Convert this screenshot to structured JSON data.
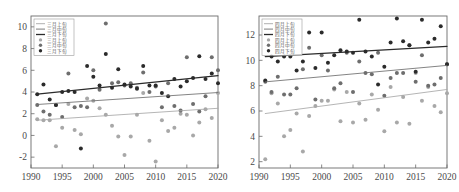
{
  "figure": {
    "name": "two-panel-scatter-trend-figure",
    "width": 459,
    "height": 192,
    "background": "#ffffff"
  },
  "colors": {
    "dark": "#2b2b2b",
    "mid": "#6e6e6e",
    "light": "#a8a8a8",
    "axis": "#6b6b6b",
    "text": "#4a4a4a"
  },
  "chart_data": [
    {
      "type": "scatter",
      "name": "march-panel",
      "title": "",
      "xlabel": "",
      "ylabel": "",
      "xlim": [
        1990,
        2020
      ],
      "ylim": [
        -3,
        11
      ],
      "xticks": [
        1990,
        1995,
        2000,
        2005,
        2010,
        2015,
        2020
      ],
      "yticks": [
        -2,
        0,
        2,
        4,
        6,
        8,
        10
      ],
      "grid": false,
      "legend_position": "upper-left",
      "legend": [
        {
          "label": "三月上旬",
          "type": "line",
          "color": "#a8a8a8"
        },
        {
          "label": "三月中旬",
          "type": "line",
          "color": "#6e6e6e"
        },
        {
          "label": "三月下旬",
          "type": "line",
          "color": "#2b2b2b"
        },
        {
          "label": "三月上旬",
          "type": "marker",
          "color": "#a8a8a8"
        },
        {
          "label": "三月中旬",
          "type": "marker",
          "color": "#6e6e6e"
        },
        {
          "label": "三月下旬",
          "type": "marker",
          "color": "#2b2b2b"
        }
      ],
      "trendlines": [
        {
          "name": "三月下旬",
          "color": "#2b2b2b",
          "x": [
            1991,
            2020
          ],
          "y": [
            3.8,
            5.5
          ]
        },
        {
          "name": "三月中旬",
          "color": "#6e6e6e",
          "x": [
            1991,
            2020
          ],
          "y": [
            2.85,
            3.95
          ]
        },
        {
          "name": "三月上旬",
          "color": "#a8a8a8",
          "x": [
            1991,
            2020
          ],
          "y": [
            1.4,
            2.5
          ]
        }
      ],
      "series": [
        {
          "name": "三月下旬",
          "color": "#2b2b2b",
          "x": [
            1991,
            1992,
            1993,
            1994,
            1995,
            1996,
            1997,
            1998,
            1999,
            2000,
            2001,
            2002,
            2003,
            2004,
            2005,
            2006,
            2007,
            2008,
            2009,
            2010,
            2011,
            2012,
            2013,
            2014,
            2015,
            2016,
            2017,
            2018,
            2019,
            2020
          ],
          "y": [
            3.8,
            4.7,
            3.3,
            2.8,
            4.0,
            4.1,
            4.0,
            -1.2,
            6.4,
            5.4,
            4.6,
            7.5,
            4.4,
            6.1,
            4.7,
            4.5,
            4.3,
            6.4,
            4.6,
            4.6,
            3.9,
            3.6,
            5.2,
            4.5,
            5.0,
            5.3,
            7.3,
            5.2,
            5.7,
            4.8
          ]
        },
        {
          "name": "三月中旬",
          "color": "#6e6e6e",
          "x": [
            1991,
            1992,
            1993,
            1994,
            1995,
            1996,
            1997,
            1998,
            1999,
            2000,
            2001,
            2002,
            2003,
            2004,
            2005,
            2006,
            2007,
            2008,
            2009,
            2010,
            2011,
            2012,
            2013,
            2014,
            2015,
            2016,
            2017,
            2018,
            2019,
            2020
          ],
          "y": [
            2.8,
            2.2,
            1.9,
            2.8,
            1.7,
            5.7,
            2.6,
            2.7,
            2.6,
            6.0,
            4.2,
            10.3,
            4.8,
            4.9,
            4.6,
            4.8,
            4.4,
            5.8,
            4.0,
            4.5,
            2.6,
            4.8,
            2.7,
            2.3,
            7.2,
            2.9,
            2.2,
            3.6,
            7.2,
            6.0
          ]
        },
        {
          "name": "三月上旬",
          "color": "#a8a8a8",
          "x": [
            1991,
            1992,
            1993,
            1994,
            1995,
            1996,
            1997,
            1998,
            1999,
            2000,
            2001,
            2002,
            2003,
            2004,
            2005,
            2006,
            2007,
            2008,
            2009,
            2010,
            2011,
            2012,
            2013,
            2014,
            2015,
            2016,
            2017,
            2018,
            2019,
            2020
          ],
          "y": [
            1.5,
            1.4,
            1.4,
            -1.0,
            0.7,
            2.9,
            0.5,
            0.1,
            3.4,
            3.2,
            2.5,
            1.9,
            0.9,
            -0.1,
            -1.8,
            -0.1,
            1.9,
            3.9,
            -0.5,
            -2.4,
            1.4,
            0.4,
            0.7,
            2.0,
            1.9,
            0.0,
            1.2,
            2.4,
            1.6,
            3.9
          ]
        }
      ]
    },
    {
      "type": "scatter",
      "name": "april-panel",
      "title": "",
      "xlabel": "",
      "ylabel": "",
      "xlim": [
        1990,
        2020
      ],
      "ylim": [
        1.5,
        13.5
      ],
      "xticks": [
        1990,
        1995,
        2000,
        2005,
        2010,
        2015,
        2020
      ],
      "yticks": [
        2,
        4,
        6,
        8,
        10,
        12
      ],
      "grid": false,
      "legend_position": "upper-left",
      "legend": [
        {
          "label": "四月上旬",
          "type": "line",
          "color": "#a8a8a8"
        },
        {
          "label": "四月中旬",
          "type": "line",
          "color": "#6e6e6e"
        },
        {
          "label": "四月下旬",
          "type": "line",
          "color": "#2b2b2b"
        },
        {
          "label": "四月上旬",
          "type": "marker",
          "color": "#a8a8a8"
        },
        {
          "label": "四月中旬",
          "type": "marker",
          "color": "#6e6e6e"
        },
        {
          "label": "四月下旬",
          "type": "marker",
          "color": "#2b2b2b"
        }
      ],
      "trendlines": [
        {
          "name": "四月下旬",
          "color": "#2b2b2b",
          "x": [
            1991,
            2020
          ],
          "y": [
            10.3,
            11.1
          ]
        },
        {
          "name": "四月中旬",
          "color": "#6e6e6e",
          "x": [
            1991,
            2020
          ],
          "y": [
            8.3,
            9.6
          ]
        },
        {
          "name": "四月上旬",
          "color": "#a8a8a8",
          "x": [
            1991,
            2020
          ],
          "y": [
            5.8,
            7.7
          ]
        }
      ],
      "series": [
        {
          "name": "四月下旬",
          "color": "#2b2b2b",
          "x": [
            1991,
            1992,
            1993,
            1994,
            1995,
            1996,
            1997,
            1998,
            1999,
            2000,
            2001,
            2002,
            2003,
            2004,
            2005,
            2006,
            2007,
            2008,
            2009,
            2010,
            2011,
            2012,
            2013,
            2014,
            2015,
            2016,
            2017,
            2018,
            2019,
            2020
          ],
          "y": [
            8.4,
            10.3,
            9.9,
            10.3,
            10.3,
            9.2,
            9.9,
            12.2,
            9.4,
            12.2,
            9.8,
            10.4,
            10.8,
            10.7,
            10.6,
            13.2,
            10.7,
            10.3,
            8.1,
            9.5,
            11.4,
            13.3,
            11.5,
            11.2,
            9.1,
            13.2,
            11.4,
            11.7,
            12.7,
            9.7
          ]
        },
        {
          "name": "四月中旬",
          "color": "#6e6e6e",
          "x": [
            1991,
            1992,
            1993,
            1994,
            1995,
            1996,
            1997,
            1998,
            1999,
            2000,
            2001,
            2002,
            2003,
            2004,
            2005,
            2006,
            2007,
            2008,
            2009,
            2010,
            2011,
            2012,
            2013,
            2014,
            2015,
            2016,
            2017,
            2018,
            2019,
            2020
          ],
          "y": [
            8.3,
            7.5,
            8.7,
            7.3,
            7.3,
            7.8,
            9.3,
            11.0,
            6.9,
            10.4,
            9.2,
            7.8,
            8.2,
            10.6,
            7.5,
            9.9,
            9.0,
            8.9,
            10.6,
            7.2,
            8.6,
            9.0,
            9.0,
            11.2,
            8.3,
            10.4,
            8.0,
            8.1,
            8.6,
            9.7
          ]
        },
        {
          "name": "四月上旬",
          "color": "#a8a8a8",
          "x": [
            1991,
            1992,
            1993,
            1994,
            1995,
            1996,
            1997,
            1998,
            1999,
            2000,
            2001,
            2002,
            2003,
            2004,
            2005,
            2006,
            2007,
            2008,
            2009,
            2010,
            2011,
            2012,
            2013,
            2014,
            2015,
            2016,
            2017,
            2018,
            2019,
            2020
          ],
          "y": [
            2.2,
            7.4,
            6.6,
            4.0,
            4.5,
            5.8,
            2.8,
            5.6,
            6.4,
            6.8,
            6.8,
            7.7,
            5.2,
            7.5,
            5.1,
            6.6,
            5.3,
            7.3,
            6.1,
            4.4,
            7.9,
            5.1,
            7.1,
            5.0,
            9.0,
            6.8,
            7.9,
            6.4,
            5.9,
            7.4
          ]
        }
      ]
    }
  ]
}
